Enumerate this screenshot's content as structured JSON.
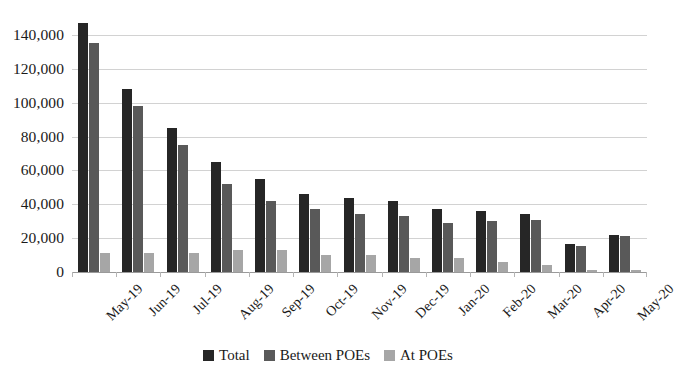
{
  "chart_data": {
    "type": "bar",
    "title": "",
    "subtitle": "",
    "xlabel": "",
    "ylabel": "",
    "ylim": [
      0,
      160000
    ],
    "y_ticks": [
      0,
      20000,
      40000,
      60000,
      80000,
      100000,
      120000,
      140000
    ],
    "y_tick_labels": [
      "0",
      "20,000",
      "40,000",
      "60,000",
      "80,000",
      "100,000",
      "120,000",
      "140,000"
    ],
    "grid": true,
    "legend_position": "bottom",
    "categories": [
      "May-19",
      "Jun-19",
      "Jul-19",
      "Aug-19",
      "Sep-19",
      "Oct-19",
      "Nov-19",
      "Dec-19",
      "Jan-20",
      "Feb-20",
      "Mar-20",
      "Apr-20",
      "May-20"
    ],
    "series": [
      {
        "name": "Total",
        "color": "#262626",
        "values": [
          147000,
          108000,
          85000,
          65000,
          55000,
          46000,
          44000,
          42000,
          37000,
          36000,
          34000,
          16500,
          22000
        ]
      },
      {
        "name": "Between POEs",
        "color": "#595959",
        "values": [
          135000,
          98000,
          75000,
          52000,
          42000,
          37000,
          34000,
          33000,
          29000,
          30000,
          31000,
          15500,
          21000
        ]
      },
      {
        "name": "At POEs",
        "color": "#a6a6a6",
        "values": [
          11000,
          11000,
          11500,
          13000,
          13000,
          10000,
          10000,
          8000,
          8000,
          6000,
          4000,
          1000,
          1000
        ]
      }
    ]
  },
  "legend": {
    "items": [
      {
        "label": "Total",
        "swatch": "total"
      },
      {
        "label": "Between POEs",
        "swatch": "between"
      },
      {
        "label": "At POEs",
        "swatch": "atpoes"
      }
    ]
  }
}
